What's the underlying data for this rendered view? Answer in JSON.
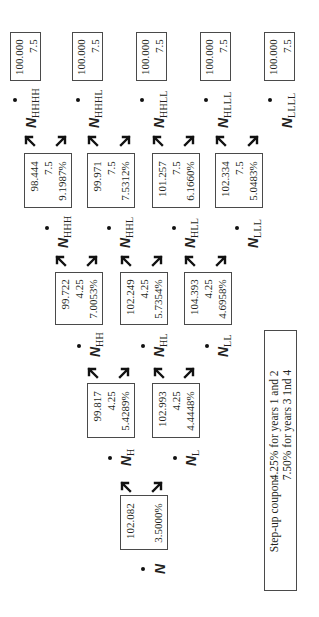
{
  "diagram": {
    "type": "binomial-interest-rate-tree",
    "orientation": "rotated-90-ccw",
    "nodes": [
      {
        "id": "root",
        "label": "N",
        "sub": "",
        "values": [
          "102.082",
          "",
          "3.5000%"
        ]
      },
      {
        "id": "H",
        "label": "N",
        "sub": "H",
        "values": [
          "99.817",
          "4.25",
          "5.4289%"
        ]
      },
      {
        "id": "L",
        "label": "N",
        "sub": "L",
        "values": [
          "102.993",
          "4.25",
          "4.4448%"
        ]
      },
      {
        "id": "HH",
        "label": "N",
        "sub": "HH",
        "values": [
          "99.722",
          "4.25",
          "7.0053%"
        ]
      },
      {
        "id": "HL",
        "label": "N",
        "sub": "HL",
        "values": [
          "102.249",
          "4.25",
          "5.7354%"
        ]
      },
      {
        "id": "LL",
        "label": "N",
        "sub": "LL",
        "values": [
          "104.393",
          "4.25",
          "4.6958%"
        ]
      },
      {
        "id": "HHH",
        "label": "N",
        "sub": "HHH",
        "values": [
          "98.444",
          "7.5",
          "9.1987%"
        ]
      },
      {
        "id": "HHL",
        "label": "N",
        "sub": "HHL",
        "values": [
          "99.971",
          "7.5",
          "7.5312%"
        ]
      },
      {
        "id": "HLL",
        "label": "N",
        "sub": "HLL",
        "values": [
          "101.257",
          "7.5",
          "6.1660%"
        ]
      },
      {
        "id": "LLL",
        "label": "N",
        "sub": "LLL",
        "values": [
          "102.334",
          "7.5",
          "5.0483%"
        ]
      },
      {
        "id": "HHHH",
        "label": "N",
        "sub": "HHHH",
        "values": [
          "100.000",
          "7.5"
        ]
      },
      {
        "id": "HHHL",
        "label": "N",
        "sub": "HHHL",
        "values": [
          "100.000",
          "7.5"
        ]
      },
      {
        "id": "HHLL",
        "label": "N",
        "sub": "HHLL",
        "values": [
          "100.000",
          "7.5"
        ]
      },
      {
        "id": "HLLL",
        "label": "N",
        "sub": "HLLL",
        "values": [
          "100.000",
          "7.5"
        ]
      },
      {
        "id": "LLLL",
        "label": "N",
        "sub": "LLLL",
        "values": [
          "100.000",
          "7.5"
        ]
      }
    ],
    "legend": {
      "key": "Step-up coupon:",
      "line1": "4.25% for years 1 and 2",
      "line2": "7.50% for years 3 1nd 4"
    }
  }
}
